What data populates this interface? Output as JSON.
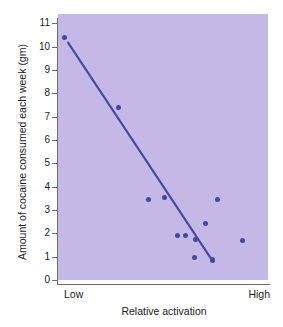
{
  "chart_data": {
    "type": "scatter",
    "title": "",
    "xlabel": "Relative activation",
    "ylabel": "Amount of cocaine consumed each week (gm)",
    "xlim": [
      0,
      1
    ],
    "ylim": [
      0,
      11.4
    ],
    "grid": false,
    "legend": null,
    "x_category_labels": [
      "Low",
      "High"
    ],
    "y_ticks": [
      0,
      1,
      2,
      3,
      4,
      5,
      6,
      7,
      8,
      9,
      10,
      11
    ],
    "y_tick_labels": [
      "0",
      "1",
      "2",
      "3",
      "4",
      "5",
      "6",
      "7",
      "8",
      "9",
      "10",
      "11"
    ],
    "points": [
      {
        "x": 0.03,
        "y": 10.4
      },
      {
        "x": 0.29,
        "y": 7.4
      },
      {
        "x": 0.43,
        "y": 3.45
      },
      {
        "x": 0.505,
        "y": 3.53
      },
      {
        "x": 0.57,
        "y": 1.92
      },
      {
        "x": 0.605,
        "y": 1.92
      },
      {
        "x": 0.655,
        "y": 1.72
      },
      {
        "x": 0.65,
        "y": 0.95
      },
      {
        "x": 0.7,
        "y": 2.42
      },
      {
        "x": 0.735,
        "y": 0.88
      },
      {
        "x": 0.735,
        "y": 0.82
      },
      {
        "x": 0.76,
        "y": 3.45
      },
      {
        "x": 0.88,
        "y": 1.68
      }
    ],
    "trendline": {
      "x0": 0.048,
      "y0": 10.17,
      "x1": 0.735,
      "y1": 0.83,
      "color": "#4747a0"
    },
    "colors": {
      "panel_background": "#c4b9e6",
      "marker": "#4747a0",
      "axis": "#6d6d6d",
      "text": "#1a1a1a",
      "figure_background": "#ffffff"
    }
  }
}
